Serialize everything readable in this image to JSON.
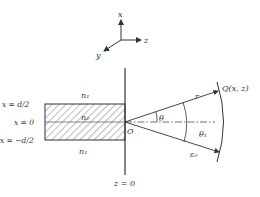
{
  "axes": {
    "x": "x",
    "y": "y",
    "z": "z"
  },
  "slab": {
    "top_label": "x = d/2",
    "center_label": "x = 0",
    "bottom_label": "x = −d/2",
    "cladding_top": "n₁",
    "core": "n₂",
    "cladding_bottom": "n₁"
  },
  "boundary_label": "z = 0",
  "origin_label": "O",
  "rays": {
    "r_label": "r",
    "point_label": "Q(x, z)",
    "theta_label": "θ",
    "theta1_label": "θ₁",
    "lower_ray_label": "ε₀"
  },
  "colors": {
    "line": "#333333",
    "background": "#ffffff"
  }
}
